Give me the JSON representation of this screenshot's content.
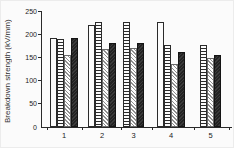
{
  "chart_data": {
    "type": "bar",
    "title": "",
    "xlabel": "",
    "ylabel": "Breakdown strength (kV/mm)",
    "ylim": [
      0,
      250
    ],
    "yticks": [
      0,
      50,
      100,
      150,
      200,
      250
    ],
    "categories": [
      "1",
      "2",
      "3",
      "4",
      "5"
    ],
    "series": [
      {
        "name": "open-white-bar",
        "pattern": "plain-white",
        "values": [
          192,
          219,
          null,
          227,
          null
        ]
      },
      {
        "name": "horizontal-stripe-bar",
        "pattern": "horizontal-stripes",
        "values": [
          190,
          226,
          226,
          177,
          176
        ]
      },
      {
        "name": "diagonal-hatch-bar",
        "pattern": "diagonal-hatch",
        "values": [
          155,
          169,
          171,
          136,
          148
        ]
      },
      {
        "name": "solid-dark-bar",
        "pattern": "solid-black",
        "values": [
          192,
          181,
          182,
          161,
          156
        ]
      }
    ],
    "legend": "none",
    "grid": false,
    "colors": {
      "ink": "#2a2a2a",
      "paper": "#fbfbfb",
      "hatch_gray": "#8f8f8f"
    }
  }
}
